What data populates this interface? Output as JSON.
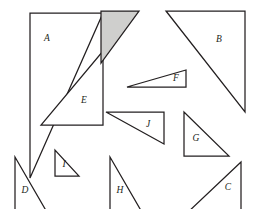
{
  "figure": {
    "canvas": {
      "width": 253,
      "height": 209
    },
    "style": {
      "background_color": "#ffffff",
      "stroke_color": "#231f20",
      "shaded_fill_color": "#cfcfcd",
      "unshaded_fill_color": "#ffffff",
      "stroke_width": 1.25
    },
    "triangles": [
      {
        "id": "tri-a",
        "label": "A",
        "right_angle_corner": "top-left",
        "shaded": false,
        "points": "30,13 103,13 30,178",
        "label_x": 47,
        "label_y": 39
      },
      {
        "id": "tri-e",
        "label": "E",
        "right_angle_corner": "bottom-right",
        "shaded": false,
        "points": "103,51 103,125 41,125",
        "label_x": 84,
        "label_y": 101
      },
      {
        "id": "tri-shaded",
        "label": "",
        "right_angle_corner": "top-left",
        "shaded": true,
        "points": "101,11 139,11 101,63",
        "label_x": 0,
        "label_y": 0
      },
      {
        "id": "tri-b",
        "label": "B",
        "right_angle_corner": "top-right",
        "shaded": false,
        "points": "166,11 245,11 245,112",
        "label_x": 219,
        "label_y": 40
      },
      {
        "id": "tri-f",
        "label": "F",
        "right_angle_corner": "bottom-right",
        "shaded": false,
        "points": "127,87 186,70 186,87",
        "label_x": 176,
        "label_y": 79
      },
      {
        "id": "tri-j",
        "label": "J",
        "right_angle_corner": "top-right",
        "shaded": false,
        "points": "106,112 164,112 164,144",
        "label_x": 148,
        "label_y": 125
      },
      {
        "id": "tri-g",
        "label": "G",
        "right_angle_corner": "bottom-left",
        "shaded": false,
        "points": "184,112 184,156 229,156",
        "label_x": 196,
        "label_y": 139
      },
      {
        "id": "tri-i",
        "label": "I",
        "right_angle_corner": "bottom-left",
        "shaded": false,
        "points": "55,150 55,176 79,176",
        "label_x": 64,
        "label_y": 165
      },
      {
        "id": "tri-d",
        "label": "D",
        "right_angle_corner": "top-left",
        "shaded": false,
        "points": "15,157 15,214 48,214",
        "label_x": 25,
        "label_y": 191
      },
      {
        "id": "tri-h",
        "label": "H",
        "right_angle_corner": "top-left",
        "shaded": false,
        "points": "110,157 110,214 143,214",
        "label_x": 120,
        "label_y": 191
      },
      {
        "id": "tri-c",
        "label": "C",
        "right_angle_corner": "top-right",
        "shaded": false,
        "points": "241,162 241,214 186,214",
        "label_x": 228,
        "label_y": 188
      }
    ]
  }
}
